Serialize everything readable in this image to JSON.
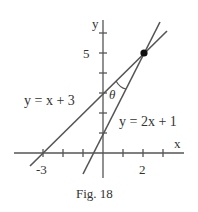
{
  "figure": {
    "caption": "Fig. 18",
    "axes": {
      "x_label": "x",
      "y_label": "y",
      "x_tick_labels": [
        {
          "value": -3,
          "text": "-3"
        },
        {
          "value": 2,
          "text": "2"
        }
      ],
      "y_tick_labels": [
        {
          "value": 5,
          "text": "5"
        }
      ]
    },
    "lines": [
      {
        "equation": "y = x + 3",
        "slope": 1,
        "intercept": 3
      },
      {
        "equation": "y = 2x + 1",
        "slope": 2,
        "intercept": 1
      }
    ],
    "intersection": {
      "x": 2,
      "y": 5
    },
    "angle_label": "θ",
    "colors": {
      "line": "#555555",
      "text": "#333333",
      "point": "#111111"
    }
  }
}
